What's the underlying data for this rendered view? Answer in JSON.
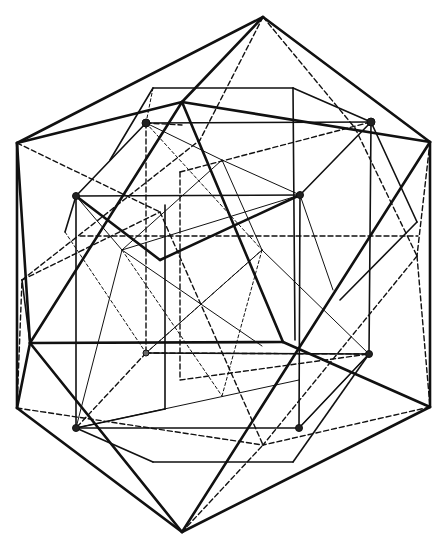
{
  "figure": {
    "title": "",
    "background": "#ffffff",
    "stroke_color": "#111111",
    "vertices": {
      "top": [
        263,
        17
      ],
      "bottom": [
        182,
        532
      ],
      "outer_left_top": [
        17,
        143
      ],
      "outer_right_top": [
        430,
        142
      ],
      "outer_left_bottom": [
        17,
        408
      ],
      "outer_right_bottom": [
        430,
        407
      ],
      "ico_upper_mid": [
        182,
        102
      ],
      "ico_left_mid": [
        30,
        343
      ],
      "ico_right_mid": [
        283,
        342
      ],
      "ico_right_low": [
        417,
        256
      ],
      "ico_left_up": [
        22,
        280
      ],
      "dot_1": [
        146,
        123
      ],
      "dot_2": [
        371,
        122
      ],
      "dot_3": [
        76,
        196
      ],
      "dot_4": [
        300,
        195
      ],
      "dot_5": [
        146,
        353
      ],
      "dot_6": [
        369,
        354
      ],
      "dot_7": [
        76,
        428
      ],
      "dot_8": [
        299,
        428
      ],
      "cube_tl": [
        153,
        88
      ],
      "cube_tr": [
        293,
        88
      ],
      "cube_bl": [
        153,
        462
      ],
      "cube_br": [
        293,
        462
      ],
      "center_upper": [
        222,
        160
      ],
      "center_lower": [
        222,
        396
      ],
      "inner_left": [
        122,
        250
      ],
      "inner_right": [
        262,
        250
      ]
    },
    "dot_markers": [
      "dot_1",
      "dot_2",
      "dot_3",
      "dot_4",
      "dot_5",
      "dot_6",
      "dot_7",
      "dot_8"
    ]
  }
}
